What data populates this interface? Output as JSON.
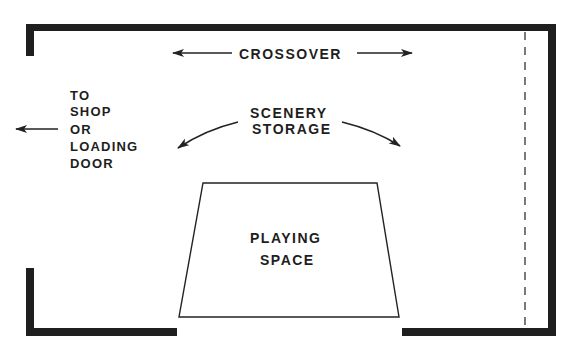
{
  "diagram": {
    "type": "stage floor plan",
    "labels": {
      "crossover": "CROSSOVER",
      "scenery_storage": [
        "SCENERY",
        "STORAGE"
      ],
      "exit": [
        "TO",
        "SHOP",
        "OR",
        "LOADING",
        "DOOR"
      ],
      "playing_space": [
        "PLAYING",
        "SPACE"
      ]
    },
    "colors": {
      "ink": "#1f1f1f",
      "background": "#ffffff"
    }
  }
}
